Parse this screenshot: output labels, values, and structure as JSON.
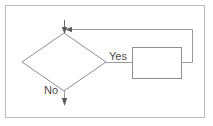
{
  "diagram": {
    "type": "flowchart",
    "title": "",
    "frame": {
      "border_color": "#b9b9b9",
      "background_color": "#ffffff"
    },
    "stroke_color": "#8f8f8f",
    "text_color": "#4a4a4a",
    "nodes": [
      {
        "id": "decision",
        "shape": "diamond",
        "label": "",
        "x": 64,
        "y": 62,
        "half_width": 42,
        "half_height": 29
      },
      {
        "id": "process",
        "shape": "rectangle",
        "label": "",
        "x": 132,
        "y": 47,
        "width": 49,
        "height": 31
      }
    ],
    "edges": [
      {
        "id": "entry",
        "from": "",
        "to": "decision",
        "label": "",
        "arrow": "down-into-decision-top"
      },
      {
        "id": "yes-branch",
        "from": "decision",
        "to": "process",
        "label": "Yes",
        "arrow": "none"
      },
      {
        "id": "no-branch",
        "from": "decision",
        "to": "",
        "label": "No",
        "arrow": "down"
      },
      {
        "id": "loop-back",
        "from": "process",
        "to": "decision",
        "label": "",
        "arrow": "left-into-entry-line"
      }
    ],
    "labels": {
      "yes": "Yes",
      "no": "No"
    }
  }
}
